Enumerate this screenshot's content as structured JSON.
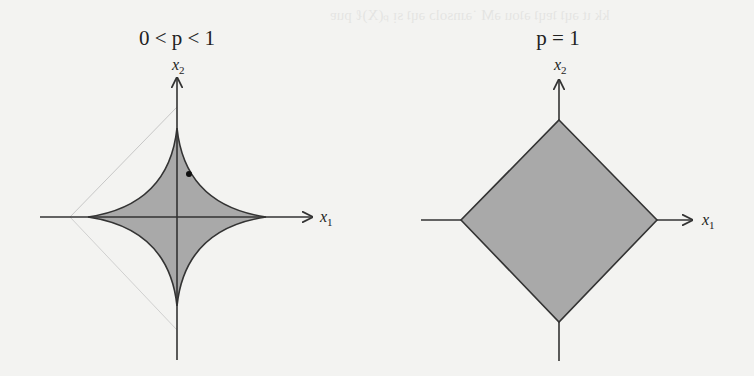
{
  "figure": {
    "panels": [
      {
        "title": "0 < p < 1",
        "shape": "astroid (concave star)",
        "x_axis_label": "x",
        "x_axis_sub": "1",
        "y_axis_label": "x",
        "y_axis_sub": "2"
      },
      {
        "title": "p = 1",
        "shape": "diamond",
        "x_axis_label": "x",
        "x_axis_sub": "1",
        "y_axis_label": "x",
        "y_axis_sub": "2"
      }
    ],
    "colors": {
      "fill": "#a9a9a9",
      "stroke": "#333333",
      "background": "#f3f3f1"
    }
  }
}
